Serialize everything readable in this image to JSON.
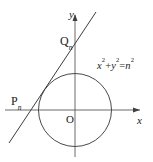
{
  "figure": {
    "background_color": "#ffffff",
    "stroke_color": "#4d4d4d",
    "text_color": "#1a1a1a",
    "width": 153,
    "height": 162
  },
  "axes": {
    "x_label": "x",
    "y_label": "y",
    "origin_label": "O",
    "x_axis": {
      "x1": 5,
      "y1": 110,
      "x2": 140,
      "y2": 110
    },
    "y_axis": {
      "x1": 75,
      "y1": 155,
      "x2": 75,
      "y2": 14
    }
  },
  "circle": {
    "equation_text": "x",
    "equation_parts": {
      "x_var": "x",
      "x_exp": "2",
      "plus": "+",
      "y_var": "y",
      "y_exp": "2",
      "equals": "=",
      "n_var": "n",
      "n_exp": "2"
    },
    "center_x": 75,
    "center_y": 110,
    "radius": 36
  },
  "line": {
    "label": "tangent-line",
    "x1": 9,
    "y1": 143,
    "x2": 96,
    "y2": 12
  },
  "points": {
    "p": {
      "letter": "P",
      "subscript": "n"
    },
    "q": {
      "letter": "Q",
      "subscript": "n"
    }
  }
}
